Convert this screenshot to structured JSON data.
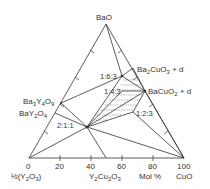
{
  "diagram": {
    "type": "ternary-phase-diagram",
    "vertices": {
      "top": {
        "label": "BaO",
        "x": 106,
        "y": 24
      },
      "left": {
        "label": "½(Y₂O₃)",
        "x": 29,
        "y": 158
      },
      "right": {
        "label": "CuO",
        "x": 184,
        "y": 158
      }
    },
    "axis": {
      "label": "Mol %",
      "ticks": [
        "0",
        "20",
        "40",
        "60",
        "80",
        "100"
      ]
    },
    "phases": [
      {
        "id": "ba2cuo3",
        "label": "Ba₂CuO₃ + d",
        "x": 133,
        "y": 68
      },
      {
        "id": "bacuo2",
        "label": "BaCuO₂ + d",
        "x": 145,
        "y": 91
      },
      {
        "id": "p163",
        "label": "1:6:3",
        "x": 122,
        "y": 76
      },
      {
        "id": "p143",
        "label": "1:4:3",
        "x": 122,
        "y": 91
      },
      {
        "id": "p123",
        "label": "1:2:3",
        "x": 133,
        "y": 112
      },
      {
        "id": "p211",
        "label": "2:1:1",
        "x": 87,
        "y": 127
      },
      {
        "id": "ba3y4o9",
        "label": "Ba₃Y₄O₉",
        "x": 61,
        "y": 103
      },
      {
        "id": "bay2o4",
        "label": "BaY₂O₄",
        "x": 55,
        "y": 113
      },
      {
        "id": "y2cu2o5",
        "label": "Y₂Cu₂O₅",
        "x": 106,
        "y": 158
      }
    ],
    "labels": {
      "top": "BaO",
      "cuo": "CuO",
      "y2o3": "½(Y",
      "y2cu2o5": "Y",
      "mol": "Mol %",
      "ba2cuo3": "Ba",
      "bacuo2": "BaCuO",
      "p163": "1:6:3",
      "p143": "1:4:3",
      "p123": "1:2:3",
      "p211": "2:1:1",
      "ba3y4o9": "Ba",
      "bay2o4": "BaY"
    },
    "colors": {
      "line": "#333333",
      "text": "#333333",
      "background": "#ffffff"
    }
  }
}
